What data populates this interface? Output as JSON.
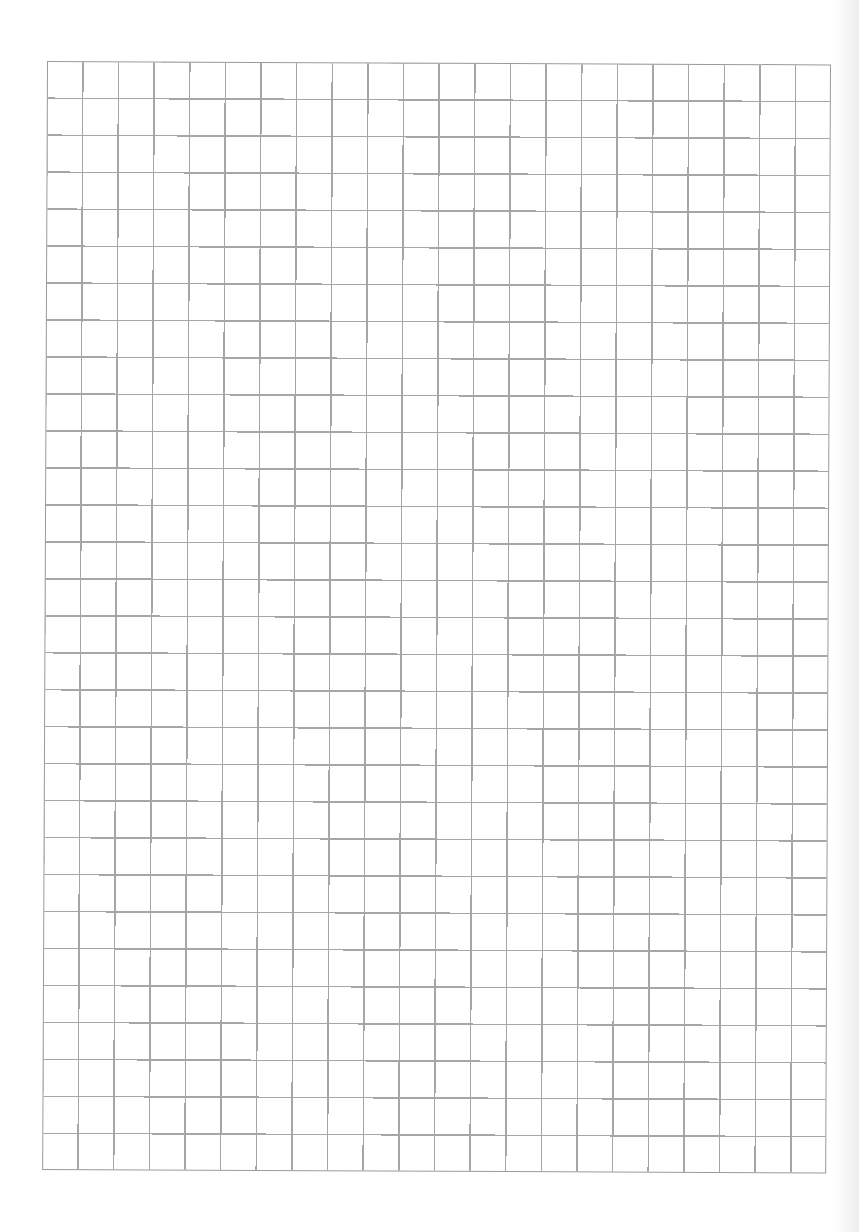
{
  "page": {
    "type": "grid paper",
    "columns": 22,
    "rows": 30,
    "line_color": "#a6a6a6",
    "background_color": "#ffffff"
  }
}
